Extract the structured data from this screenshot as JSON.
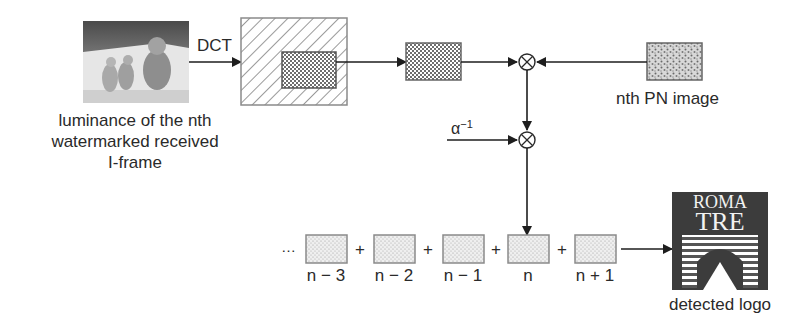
{
  "diagram": {
    "input_frame": {
      "icon": "photo-thumbnail-kitten-ducklings",
      "caption_lines": [
        "luminance of the nth",
        "watermarked received",
        "I-frame"
      ]
    },
    "transform_label": "DCT",
    "pn_image_label": "nth PN image",
    "scale_label": "α",
    "scale_exponent": "−1",
    "multiply_symbol": "⊗",
    "sequence": {
      "ellipsis": "…",
      "plus": "+",
      "items": [
        {
          "label": "n − 3"
        },
        {
          "label": "n − 2"
        },
        {
          "label": "n − 1"
        },
        {
          "label": "n"
        },
        {
          "label": "n + 1"
        }
      ]
    },
    "output": {
      "logo_text_top": "ROMA",
      "logo_text_bottom": "TRE",
      "caption": "detected logo"
    }
  }
}
